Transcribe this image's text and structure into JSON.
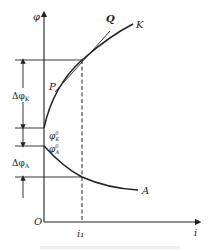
{
  "diagram": {
    "axes": {
      "y_label": "φ",
      "x_label": "i",
      "origin_label": "O",
      "x_tick_label": "i₁"
    },
    "curves": {
      "upper_curve_label": "K",
      "tangent_label": "Q",
      "point_label": "P",
      "lower_curve_label": "A"
    },
    "levels": {
      "delta_phi_k": "Δφ",
      "delta_phi_k_sub": "K",
      "phi_k0": "φ",
      "phi_k0_sup": "0",
      "phi_k0_sub": "K",
      "phi_a0": "φ",
      "phi_a0_sup": "0",
      "phi_a0_sub": "A",
      "delta_phi_a": "Δφ",
      "delta_phi_a_sub": "A"
    },
    "colors": {
      "line": "#222222",
      "caption": "#cfcfcf"
    }
  }
}
